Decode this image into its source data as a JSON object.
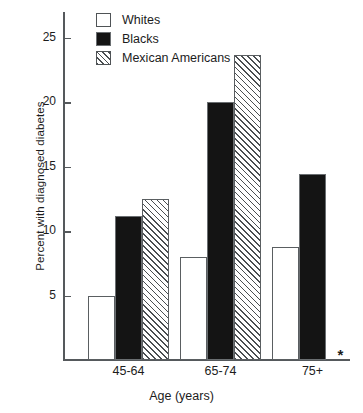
{
  "chart_data": {
    "type": "bar",
    "title": "",
    "xlabel": "Age  (years)",
    "ylabel": "Percent with diagnosed diabetes",
    "categories": [
      "45-64",
      "65-74",
      "75+"
    ],
    "series": [
      {
        "name": "Whites",
        "style": "white",
        "values": [
          5.0,
          8.0,
          8.8
        ]
      },
      {
        "name": "Blacks",
        "style": "black",
        "values": [
          11.2,
          20.0,
          14.4
        ]
      },
      {
        "name": "Mexican Americans",
        "style": "hatch",
        "values": [
          12.5,
          23.7,
          null
        ]
      }
    ],
    "ylim": [
      0,
      27
    ],
    "yticks": [
      5,
      10,
      15,
      20,
      25
    ],
    "ytick_labels": [
      "5",
      "10",
      "15",
      "20",
      "25"
    ],
    "grid": false,
    "legend_position": "top-left",
    "missing_marker": "*",
    "missing_note": "Mexican Americans, 75+ : data not available"
  },
  "legend": {
    "items": [
      {
        "label": "Whites",
        "style": "white"
      },
      {
        "label": "Blacks",
        "style": "black"
      },
      {
        "label": "Mexican Americans",
        "style": "hatch"
      }
    ]
  },
  "axes": {
    "y_title": "Percent with diagnosed diabetes",
    "x_title": "Age  (years)"
  }
}
